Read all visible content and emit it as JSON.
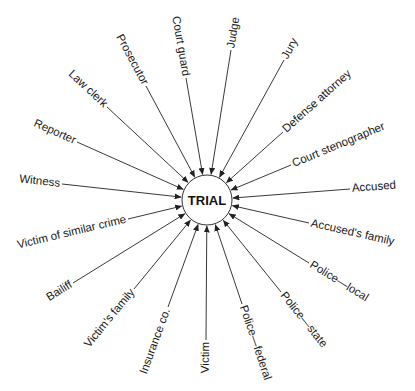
{
  "diagram": {
    "type": "hub-and-spoke",
    "center": {
      "label": "TRIAL",
      "x": 207,
      "y": 200,
      "r": 25
    },
    "colors": {
      "line": "#222222",
      "text": "#1a1a1a",
      "background": "#ffffff"
    },
    "nodes": [
      {
        "label": "Court guard",
        "x": 186,
        "y": 78,
        "angle": 90,
        "anchor": "end",
        "ex": 186,
        "ey": 78,
        "tx": 184,
        "ty": 20
      },
      {
        "label": "Judge",
        "x": 231,
        "y": 48,
        "angle": -83,
        "anchor": "start",
        "ex": 231,
        "ey": 50,
        "tx": 233,
        "ty": 47
      },
      {
        "label": "Jury",
        "x": 285,
        "y": 58,
        "angle": -60,
        "anchor": "start",
        "ex": 284,
        "ey": 60,
        "tx": 286,
        "ty": 56
      },
      {
        "label": "Defense attorney",
        "x": 283,
        "y": 130,
        "angle": -45,
        "anchor": "start",
        "ex": 283,
        "ey": 132,
        "tx": 286,
        "ty": 128
      },
      {
        "label": "Court stenographer",
        "x": 293,
        "y": 163,
        "angle": -25,
        "anchor": "start",
        "ex": 291,
        "ey": 165,
        "tx": 294,
        "ty": 162
      },
      {
        "label": "Accused",
        "x": 351,
        "y": 186,
        "angle": -3,
        "anchor": "start",
        "ex": 350,
        "ey": 189,
        "tx": 352,
        "ty": 190
      },
      {
        "label": "Accused's family",
        "x": 310,
        "y": 222,
        "angle": 15,
        "anchor": "start",
        "ex": 309,
        "ey": 223,
        "tx": 311,
        "ty": 226
      },
      {
        "label": "Police—local",
        "x": 309,
        "y": 262,
        "angle": 35,
        "anchor": "start",
        "ex": 309,
        "ey": 263,
        "tx": 311,
        "ty": 266
      },
      {
        "label": "Police—state",
        "x": 281,
        "y": 291,
        "angle": 57,
        "anchor": "start",
        "ex": 281,
        "ey": 292,
        "tx": 282,
        "ty": 296
      },
      {
        "label": "Police—federal",
        "x": 242,
        "y": 303,
        "angle": 75,
        "anchor": "start",
        "ex": 242,
        "ey": 304,
        "tx": 243,
        "ty": 308
      },
      {
        "label": "Victim",
        "x": 206,
        "y": 340,
        "angle": -90,
        "anchor": "end",
        "ex": 206,
        "ey": 340,
        "tx": 210,
        "ty": 343
      },
      {
        "label": "Insurance co.",
        "x": 168,
        "y": 308,
        "angle": -75,
        "anchor": "start",
        "ex": 168,
        "ey": 307,
        "tx": 170,
        "ty": 372
      },
      {
        "label": "Victim's family",
        "x": 134,
        "y": 289,
        "angle": -57,
        "anchor": "end",
        "ex": 134,
        "ey": 289,
        "tx": 134,
        "ty": 292
      },
      {
        "label": "Bailiff",
        "x": 73,
        "y": 283,
        "angle": -35,
        "anchor": "end",
        "ex": 73,
        "ey": 283,
        "tx": 72,
        "ty": 287
      },
      {
        "label": "Victim of similar crime",
        "x": 129,
        "y": 218,
        "angle": -13,
        "anchor": "end",
        "ex": 128,
        "ey": 219,
        "tx": 126,
        "ty": 224
      },
      {
        "label": "Witness",
        "x": 62,
        "y": 184,
        "angle": 3,
        "anchor": "end",
        "ex": 62,
        "ey": 184,
        "tx": 59,
        "ty": 188
      },
      {
        "label": "Reporter",
        "x": 77,
        "y": 140,
        "angle": 20,
        "anchor": "end",
        "ex": 77,
        "ey": 142,
        "tx": 75,
        "ty": 142
      },
      {
        "label": "Law clerk",
        "x": 107,
        "y": 106,
        "angle": 38,
        "anchor": "end",
        "ex": 107,
        "ey": 107,
        "tx": 105,
        "ty": 107
      },
      {
        "label": "Prosecutor",
        "x": 146,
        "y": 84,
        "angle": 60,
        "anchor": "end",
        "ex": 146,
        "ey": 86,
        "tx": 145,
        "ty": 83
      }
    ]
  }
}
